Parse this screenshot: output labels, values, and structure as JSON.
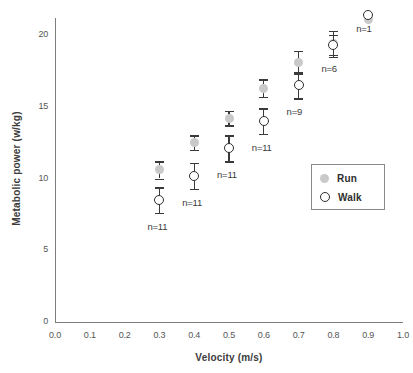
{
  "chart_data": {
    "type": "scatter",
    "title": "",
    "xlabel": "Velocity (m/s)",
    "ylabel": "Metabolic power (w/kg)",
    "xlim": [
      0.0,
      1.0
    ],
    "ylim": [
      0,
      22
    ],
    "grid": false,
    "legend_position": "center-right",
    "xticks": [
      "0.0",
      "0.1",
      "0.2",
      "0.3",
      "0.4",
      "0.5",
      "0.6",
      "0.7",
      "0.8",
      "0.9",
      "1.0"
    ],
    "yticks": [
      "0",
      "5",
      "10",
      "15",
      "20"
    ],
    "x": [
      0.3,
      0.4,
      0.5,
      0.6,
      0.7,
      0.8,
      0.9
    ],
    "series": [
      {
        "name": "Run",
        "marker": "filled-circle",
        "color": "#c9c9c9",
        "values": [
          10.6,
          12.5,
          14.2,
          16.3,
          18.1,
          19.4,
          21.1
        ],
        "errors": [
          0.6,
          0.5,
          0.5,
          0.6,
          0.8,
          0.9,
          0.0
        ]
      },
      {
        "name": "Walk",
        "marker": "open-circle",
        "color": "#2e2e2e",
        "values": [
          8.5,
          10.2,
          12.1,
          14.0,
          16.5,
          19.3,
          21.4
        ],
        "errors": [
          0.9,
          0.9,
          0.9,
          0.9,
          0.9,
          0.7,
          0.0
        ]
      }
    ],
    "annotations": [
      {
        "text": "n=11",
        "x": 0.3
      },
      {
        "text": "n=11",
        "x": 0.4
      },
      {
        "text": "n=11",
        "x": 0.5
      },
      {
        "text": "n=11",
        "x": 0.6
      },
      {
        "text": "n=9",
        "x": 0.7
      },
      {
        "text": "n=6",
        "x": 0.8
      },
      {
        "text": "n=1",
        "x": 0.9
      }
    ]
  },
  "axes": {
    "y_title": "Metabolic power (w/kg)",
    "x_title": "Velocity (m/s)",
    "y_ticks": [
      {
        "label": "20"
      },
      {
        "label": "15"
      },
      {
        "label": "10"
      },
      {
        "label": "5"
      },
      {
        "label": "0"
      }
    ],
    "x_ticks": [
      {
        "label": "0.0"
      },
      {
        "label": "0.1"
      },
      {
        "label": "0.2"
      },
      {
        "label": "0.3"
      },
      {
        "label": "0.4"
      },
      {
        "label": "0.5"
      },
      {
        "label": "0.6"
      },
      {
        "label": "0.7"
      },
      {
        "label": "0.8"
      },
      {
        "label": "0.9"
      },
      {
        "label": "1.0"
      }
    ]
  },
  "legend": {
    "run_label": "Run",
    "walk_label": "Walk"
  },
  "n_labels": [
    {
      "text": "n=11"
    },
    {
      "text": "n=11"
    },
    {
      "text": "n=11"
    },
    {
      "text": "n=11"
    },
    {
      "text": "n=9"
    },
    {
      "text": "n=6"
    },
    {
      "text": "n=1"
    }
  ]
}
